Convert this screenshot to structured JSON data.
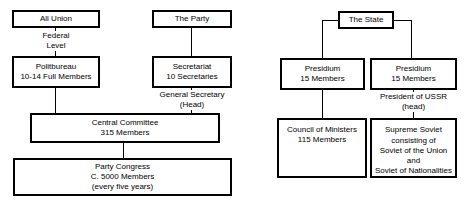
{
  "diagram": {
    "left_chart": {
      "name": "Party structure",
      "boxes": {
        "all_union": {
          "line1": "All Union"
        },
        "the_party": {
          "line1": "The Party"
        },
        "politbureau": {
          "line1": "Politbureau",
          "line2": "10-14 Full Members"
        },
        "secretariat": {
          "line1": "Secretariat",
          "line2": "10 Secretaries"
        },
        "central_committee": {
          "line1": "Central Committee",
          "line2": "315 Members"
        },
        "party_congress": {
          "line1": "Party Congress",
          "line2": "C. 5000 Members",
          "line3": "(every five years)"
        }
      },
      "labels": {
        "federal_level": {
          "line1": "Federal",
          "line2": "Level"
        },
        "general_secretary": {
          "line1": "General Secretary",
          "line2": "(Head)"
        }
      }
    },
    "right_chart": {
      "name": "State structure",
      "boxes": {
        "the_state": {
          "line1": "The State"
        },
        "presidium_left": {
          "line1": "Presidium",
          "line2": "15 Members"
        },
        "presidium_right": {
          "line1": "Presidium",
          "line2": "15 Members"
        },
        "council_of_ministers": {
          "line1": "Council of Ministers",
          "line2": "115 Members"
        },
        "supreme_soviet": {
          "line1": "Supreme Soviet",
          "line2": "consisting of",
          "line3": "Soviet of the Union",
          "line4": "and",
          "line5": "Soviet of Nationalities"
        }
      },
      "labels": {
        "president_of_ussr": {
          "line1": "President of USSR",
          "line2": "(head)"
        }
      }
    },
    "colors": {
      "stroke": "#000000",
      "background": "#ffffff",
      "text": "#000000"
    }
  }
}
